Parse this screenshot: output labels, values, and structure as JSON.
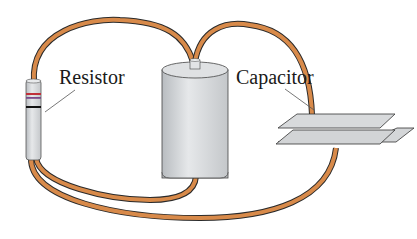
{
  "diagram": {
    "labels": {
      "resistor": "Resistor",
      "capacitor": "Capacitor"
    },
    "components": [
      "battery",
      "resistor",
      "capacitor",
      "wires"
    ],
    "colors": {
      "wire": "#d88a4a",
      "wire_outline": "#2a2a2a",
      "metal": "#d4d6d8",
      "band1": "#c0303a",
      "band2": "#7a4a8a",
      "band3": "#111111"
    }
  }
}
